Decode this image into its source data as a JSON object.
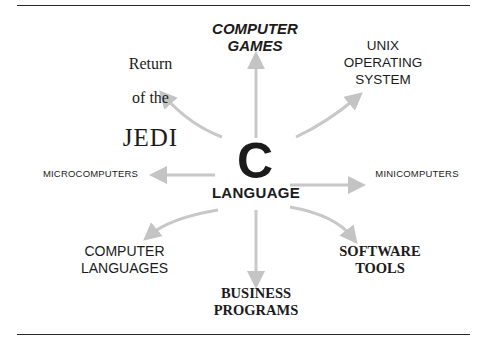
{
  "diagram": {
    "center": {
      "big_letter": "C",
      "subtitle": "LANGUAGE"
    },
    "nodes": [
      {
        "id": "jedi",
        "line1": "Return",
        "line2": "of the",
        "line3": "JEDI"
      },
      {
        "id": "games",
        "text": "COMPUTER\nGAMES"
      },
      {
        "id": "unix",
        "text": "UNIX\nOPERATING\nSYSTEM"
      },
      {
        "id": "micro",
        "text": "MICROCOMPUTERS"
      },
      {
        "id": "mini",
        "text": "MINICOMPUTERS"
      },
      {
        "id": "languages",
        "text": "COMPUTER\nLANGUAGES"
      },
      {
        "id": "business",
        "text": "BUSINESS\nPROGRAMS"
      },
      {
        "id": "tools",
        "text": "SOFTWARE\nTOOLS"
      }
    ],
    "arrow_color": "#c4c4c4",
    "text_color": "#1b1b1b"
  }
}
